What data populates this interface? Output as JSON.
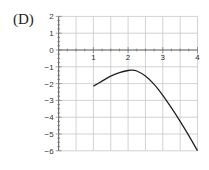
{
  "panel_label": "(D)",
  "chart_data": {
    "type": "line",
    "title": "",
    "xlabel": "",
    "ylabel": "",
    "xlim": [
      0,
      4
    ],
    "ylim": [
      -6,
      2
    ],
    "grid": true,
    "x_ticks": [
      "1",
      "2",
      "3",
      "4"
    ],
    "y_ticks": [
      "2",
      "1",
      "0",
      "-1",
      "-2",
      "-3",
      "-4",
      "-5",
      "-6"
    ],
    "series": [
      {
        "name": "f(x)",
        "color": "#222222",
        "x": [
          1.0,
          1.25,
          1.5,
          1.75,
          2.0,
          2.1,
          2.25,
          2.5,
          2.75,
          3.0,
          3.25,
          3.5,
          3.75,
          4.0
        ],
        "y": [
          -2.15,
          -1.85,
          -1.55,
          -1.35,
          -1.22,
          -1.2,
          -1.25,
          -1.55,
          -2.05,
          -2.7,
          -3.45,
          -4.25,
          -5.1,
          -6.0
        ]
      }
    ]
  }
}
